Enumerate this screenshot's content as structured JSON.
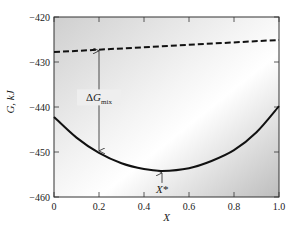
{
  "chart_data": {
    "type": "line",
    "title": "",
    "xlabel": "X",
    "ylabel": "G, kJ",
    "xlim": [
      0,
      1.0
    ],
    "ylim": [
      -460,
      -420
    ],
    "x_ticks": [
      0,
      0.2,
      0.4,
      0.6,
      0.8,
      1.0
    ],
    "x_tick_labels": [
      "0",
      "0.2",
      "0.4",
      "0.6",
      "0.8",
      "1.0"
    ],
    "y_ticks": [
      -420,
      -430,
      -440,
      -450,
      -460
    ],
    "y_tick_labels": [
      "−420",
      "−430",
      "−440",
      "−450",
      "−460"
    ],
    "grid": false,
    "legend": "none",
    "series": [
      {
        "name": "G of unmixed components",
        "style": "dashed",
        "x": [
          0,
          1.0
        ],
        "y": [
          -427.8,
          -425.1
        ]
      },
      {
        "name": "G of mixture",
        "style": "solid",
        "x": [
          0,
          0.1,
          0.2,
          0.3,
          0.4,
          0.48,
          0.6,
          0.7,
          0.8,
          0.9,
          1.0
        ],
        "y": [
          -442.2,
          -446.8,
          -450.2,
          -452.5,
          -453.8,
          -454.2,
          -453.6,
          -452.0,
          -449.6,
          -445.6,
          -439.8
        ]
      }
    ],
    "annotations": [
      {
        "text": "ΔG",
        "subscript": "mix",
        "description": "vertical double arrow from mixture curve to dashed line at X=0.2",
        "x": 0.2,
        "y_from": -450.2,
        "y_to": -427.3
      },
      {
        "text": "X*",
        "description": "arrow pointing up to curve minimum",
        "x": 0.48,
        "y": -454.2
      }
    ]
  }
}
